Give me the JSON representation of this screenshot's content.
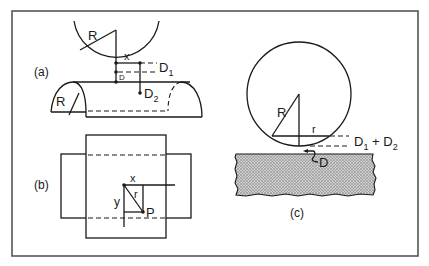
{
  "figure": {
    "frame_color": "#555555",
    "ink_color": "#1a1a1a",
    "background": "#ffffff",
    "stipple_color": "#9a9a9a"
  },
  "panels": {
    "a": {
      "label": "(a)",
      "radius_top": "R",
      "radius_bottom": "R",
      "x_label": "x",
      "d_label": "D",
      "d1_base": "D",
      "d1_sub": "1",
      "d2_base": "D",
      "d2_sub": "2"
    },
    "b": {
      "label": "(b)",
      "x_label": "x",
      "y_label": "y",
      "r_label": "r",
      "p_label": "P"
    },
    "c": {
      "label": "(c)",
      "radius_label": "R",
      "r_label": "r",
      "d_label": "D",
      "sum_d1_base": "D",
      "sum_d1_sub": "1",
      "sum_plus": " + ",
      "sum_d2_base": "D",
      "sum_d2_sub": "2"
    }
  }
}
